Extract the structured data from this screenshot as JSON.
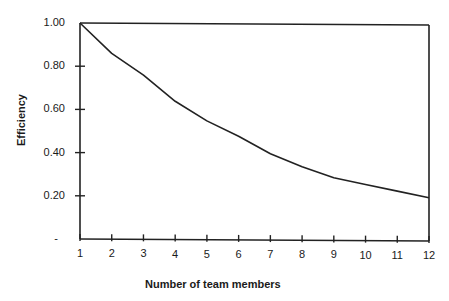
{
  "chart_data": {
    "type": "line",
    "title": "",
    "xlabel": "Number of team members",
    "ylabel": "Efficiency",
    "x": [
      1,
      2,
      3,
      4,
      5,
      6,
      7,
      8,
      9,
      10,
      11,
      12
    ],
    "series": [
      {
        "name": "Efficiency",
        "values": [
          1.0,
          0.86,
          0.76,
          0.64,
          0.55,
          0.48,
          0.4,
          0.34,
          0.29,
          0.26,
          0.23,
          0.2
        ]
      }
    ],
    "xlim": [
      1,
      12
    ],
    "ylim": [
      0,
      1.0
    ],
    "x_tick_labels": [
      "1",
      "2",
      "3",
      "4",
      "5",
      "6",
      "7",
      "8",
      "9",
      "10",
      "11",
      "12"
    ],
    "y_tick_labels": [
      "-",
      "0.20",
      "0.40",
      "0.60",
      "0.80",
      "1.00"
    ],
    "y_tick_values": [
      0,
      0.2,
      0.4,
      0.6,
      0.8,
      1.0
    ],
    "grid": false,
    "legend": null,
    "frame": "top and right border lines drawn",
    "line_color": "#222222"
  }
}
